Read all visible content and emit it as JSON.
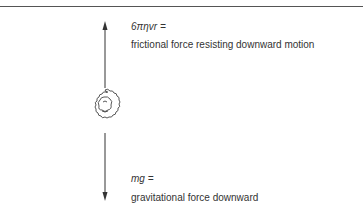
{
  "diagram": {
    "upper_force": {
      "equation": "6πηvr =",
      "description": "frictional force resisting downward motion"
    },
    "lower_force": {
      "equation": "mg =",
      "description": "gravitational force downward"
    },
    "object": "particle"
  }
}
